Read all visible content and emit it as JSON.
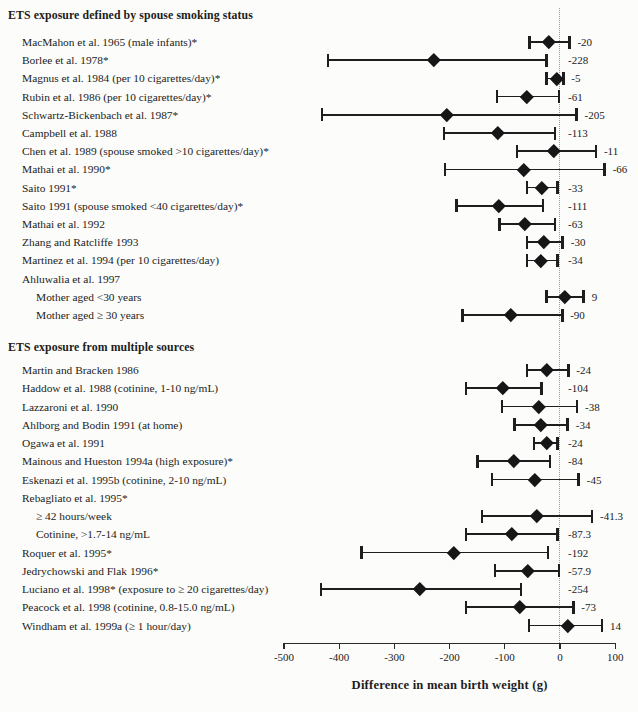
{
  "chart_data": {
    "type": "scatter",
    "variant": "forest_plot",
    "title": "",
    "xlabel": "Difference in mean birth weight (g)",
    "xlim": [
      -520,
      120
    ],
    "x_ticks": [
      -500,
      -400,
      -300,
      -200,
      -100,
      0,
      100
    ],
    "zero_reference_line": 0,
    "marker": "diamond-icon",
    "colors": {
      "marker": "#161616",
      "line": "#1e1e1e",
      "zero_line": "#9a9a92",
      "text": "#1c1c1c"
    },
    "sections": [
      {
        "title": "ETS exposure defined by spouse smoking status",
        "rows": [
          {
            "label": "MacMahon et al. 1965 (male infants)*",
            "indent": 0,
            "estimate": -20,
            "ci": [
              -55,
              17
            ],
            "value_label": "-20"
          },
          {
            "label": "Borlee et al. 1978*",
            "indent": 0,
            "estimate": -228,
            "ci": [
              -420,
              -24
            ],
            "value_label": "-228"
          },
          {
            "label": "Magnus et al. 1984 (per 10 cigarettes/day)*",
            "indent": 0,
            "estimate": -5,
            "ci": [
              -24,
              6
            ],
            "value_label": "-5"
          },
          {
            "label": "Rubin et al. 1986 (per 10 cigarettes/day)*",
            "indent": 0,
            "estimate": -61,
            "ci": [
              -114,
              -2
            ],
            "value_label": "-61"
          },
          {
            "label": "Schwartz-Bickenbach et al. 1987*",
            "indent": 0,
            "estimate": -205,
            "ci": [
              -431,
              30
            ],
            "value_label": "-205"
          },
          {
            "label": "Campbell et al. 1988",
            "indent": 0,
            "estimate": -113,
            "ci": [
              -210,
              -9
            ],
            "value_label": "-113"
          },
          {
            "label": "Chen et al. 1989 (spouse smoked >10 cigarettes/day)*",
            "indent": 0,
            "estimate": -11,
            "ci": [
              -78,
              65
            ],
            "value_label": "-11"
          },
          {
            "label": "Mathai et al. 1990*",
            "indent": 0,
            "estimate": -66,
            "ci": [
              -208,
              81
            ],
            "value_label": "-66"
          },
          {
            "label": "Saito 1991*",
            "indent": 0,
            "estimate": -33,
            "ci": [
              -60,
              -5
            ],
            "value_label": "-33"
          },
          {
            "label": "Saito 1991 (spouse smoked <40 cigarettes/day)*",
            "indent": 0,
            "estimate": -111,
            "ci": [
              -188,
              -31
            ],
            "value_label": "-111"
          },
          {
            "label": "Mathai et al. 1992",
            "indent": 0,
            "estimate": -63,
            "ci": [
              -110,
              -9
            ],
            "value_label": "-63"
          },
          {
            "label": "Zhang and Ratcliffe 1993",
            "indent": 0,
            "estimate": -30,
            "ci": [
              -60,
              5
            ],
            "value_label": "-30"
          },
          {
            "label": "Martinez et al. 1994 (per 10 cigarettes/day)",
            "indent": 0,
            "estimate": -34,
            "ci": [
              -60,
              -4
            ],
            "value_label": "-34"
          },
          {
            "label": "Ahluwalia et al. 1997",
            "indent": 0,
            "estimate": null,
            "ci": null,
            "value_label": null
          },
          {
            "label": "Mother aged <30 years",
            "indent": 1,
            "estimate": 9,
            "ci": [
              -24,
              43
            ],
            "value_label": "9"
          },
          {
            "label": "Mother aged ≥ 30 years",
            "indent": 1,
            "estimate": -90,
            "ci": [
              -177,
              4
            ],
            "value_label": "-90"
          }
        ]
      },
      {
        "title": "ETS exposure from multiple sources",
        "rows": [
          {
            "label": "Martin and Bracken 1986",
            "indent": 0,
            "estimate": -24,
            "ci": [
              -60,
              15
            ],
            "value_label": "-24"
          },
          {
            "label": "Haddow et al. 1988 (cotinine, 1-10 ng/mL)",
            "indent": 0,
            "estimate": -104,
            "ci": [
              -170,
              -34
            ],
            "value_label": "-104"
          },
          {
            "label": "Lazzaroni et al. 1990",
            "indent": 0,
            "estimate": -38,
            "ci": [
              -105,
              31
            ],
            "value_label": "-38"
          },
          {
            "label": "Ahlborg and Bodin 1991 (at home)",
            "indent": 0,
            "estimate": -34,
            "ci": [
              -82,
              14
            ],
            "value_label": "-34"
          },
          {
            "label": "Ogawa et al. 1991",
            "indent": 0,
            "estimate": -24,
            "ci": [
              -47,
              -4
            ],
            "value_label": "-24"
          },
          {
            "label": "Mainous and Hueston 1994a (high exposure)*",
            "indent": 0,
            "estimate": -84,
            "ci": [
              -149,
              -18
            ],
            "value_label": "-84"
          },
          {
            "label": "Eskenazi et al. 1995b (cotinine, 2-10 ng/mL)",
            "indent": 0,
            "estimate": -45,
            "ci": [
              -123,
              34
            ],
            "value_label": "-45"
          },
          {
            "label": "Rebagliato et al. 1995*",
            "indent": 0,
            "estimate": null,
            "ci": null,
            "value_label": null
          },
          {
            "label": "≥ 42 hours/week",
            "indent": 1,
            "estimate": -41.3,
            "ci": [
              -141,
              58
            ],
            "value_label": "-41.3"
          },
          {
            "label": "Cotinine, >1.7-14 ng/mL",
            "indent": 1,
            "estimate": -87.3,
            "ci": [
              -170,
              -4
            ],
            "value_label": "-87.3"
          },
          {
            "label": "Roquer et al. 1995*",
            "indent": 0,
            "estimate": -192,
            "ci": [
              -360,
              -22
            ],
            "value_label": "-192"
          },
          {
            "label": "Jedrychowski and Flak 1996*",
            "indent": 0,
            "estimate": -57.9,
            "ci": [
              -118,
              -2
            ],
            "value_label": "-57.9"
          },
          {
            "label": "Luciano et al. 1998* (exposure to ≥ 20 cigarettes/day)",
            "indent": 0,
            "estimate": -254,
            "ci": [
              -433,
              -71
            ],
            "value_label": "-254"
          },
          {
            "label": "Peacock et al. 1998 (cotinine, 0.8-15.0 ng/mL)",
            "indent": 0,
            "estimate": -73,
            "ci": [
              -170,
              24
            ],
            "value_label": "-73"
          },
          {
            "label": "Windham et al. 1999a (≥ 1 hour/day)",
            "indent": 0,
            "estimate": 14,
            "ci": [
              -56,
              76
            ],
            "value_label": "14"
          }
        ]
      }
    ]
  }
}
